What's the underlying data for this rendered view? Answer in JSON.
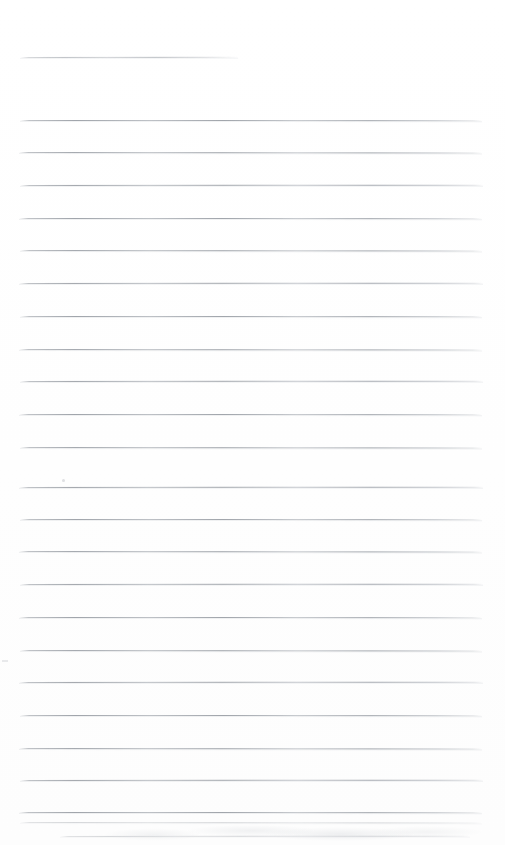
{
  "page": {
    "kind": "scanned-lined-notebook-page",
    "width": 505,
    "height": 845,
    "background_color": "#ffffff",
    "rule_color": "#a8acb2",
    "rule_color_dark": "#969ba2",
    "text_content": "",
    "has_handwriting": false,
    "has_printed_text": false,
    "note": "blank ruled page"
  },
  "rules": {
    "count": 25,
    "spacing_px": 32.7,
    "left_x": 20,
    "right_x": 482,
    "thickness_px": 1,
    "lines": [
      {
        "index": 1,
        "y": 57,
        "x1": 20,
        "x2": 238,
        "truncated": true
      },
      {
        "index": 2,
        "y": 120,
        "x1": 20,
        "x2": 482,
        "truncated": false
      },
      {
        "index": 3,
        "y": 152,
        "x1": 19,
        "x2": 482,
        "truncated": false
      },
      {
        "index": 4,
        "y": 185,
        "x1": 20,
        "x2": 483,
        "truncated": false
      },
      {
        "index": 5,
        "y": 218,
        "x1": 19,
        "x2": 482,
        "truncated": false
      },
      {
        "index": 6,
        "y": 250,
        "x1": 20,
        "x2": 482,
        "truncated": false
      },
      {
        "index": 7,
        "y": 283,
        "x1": 19,
        "x2": 483,
        "truncated": false
      },
      {
        "index": 8,
        "y": 316,
        "x1": 20,
        "x2": 482,
        "truncated": false
      },
      {
        "index": 9,
        "y": 349,
        "x1": 19,
        "x2": 482,
        "truncated": false
      },
      {
        "index": 10,
        "y": 381,
        "x1": 20,
        "x2": 483,
        "truncated": false
      },
      {
        "index": 11,
        "y": 414,
        "x1": 19,
        "x2": 482,
        "truncated": false
      },
      {
        "index": 12,
        "y": 447,
        "x1": 20,
        "x2": 482,
        "truncated": false
      },
      {
        "index": 13,
        "y": 487,
        "x1": 19,
        "x2": 483,
        "truncated": false
      },
      {
        "index": 14,
        "y": 519,
        "x1": 20,
        "x2": 482,
        "truncated": false
      },
      {
        "index": 15,
        "y": 551,
        "x1": 19,
        "x2": 482,
        "truncated": false
      },
      {
        "index": 16,
        "y": 584,
        "x1": 20,
        "x2": 483,
        "truncated": false
      },
      {
        "index": 17,
        "y": 617,
        "x1": 19,
        "x2": 482,
        "truncated": false
      },
      {
        "index": 18,
        "y": 650,
        "x1": 20,
        "x2": 482,
        "truncated": false
      },
      {
        "index": 19,
        "y": 682,
        "x1": 19,
        "x2": 483,
        "truncated": false
      },
      {
        "index": 20,
        "y": 715,
        "x1": 20,
        "x2": 482,
        "truncated": false
      },
      {
        "index": 21,
        "y": 748,
        "x1": 19,
        "x2": 482,
        "truncated": false
      },
      {
        "index": 22,
        "y": 780,
        "x1": 20,
        "x2": 483,
        "truncated": false
      },
      {
        "index": 23,
        "y": 812,
        "x1": 19,
        "x2": 482,
        "truncated": false
      },
      {
        "index": 24,
        "y": 822,
        "x1": 20,
        "x2": 482,
        "truncated": false
      },
      {
        "index": 25,
        "y": 836,
        "x1": 60,
        "x2": 470,
        "truncated": true
      }
    ]
  },
  "artifacts": {
    "bottom_smudge_visible": true,
    "left_speck_visible": true,
    "edge_speck_visible": true
  }
}
